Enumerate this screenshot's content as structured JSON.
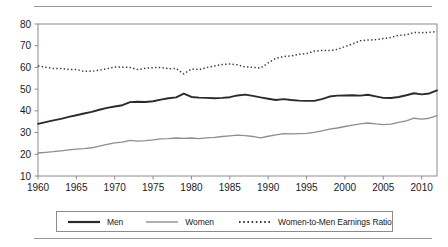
{
  "chart_data": {
    "type": "line",
    "title": "",
    "subtitle": "",
    "xlabel": "",
    "ylabel": "",
    "xlim": [
      1960,
      2012
    ],
    "ylim": [
      10,
      80
    ],
    "ytick_step": 10,
    "grid": false,
    "legend_position": "bottom",
    "xticks": [
      1960,
      1965,
      1970,
      1975,
      1980,
      1985,
      1990,
      1995,
      2000,
      2005,
      2010
    ],
    "xtick_labels": [
      "1960",
      "1965",
      "1970",
      "1975",
      "1980",
      "1985",
      "1990",
      "1995",
      "2000",
      "2005",
      "2010"
    ],
    "yticks": [
      10,
      20,
      30,
      40,
      50,
      60,
      70,
      80
    ],
    "ytick_labels": [
      "10",
      "20",
      "30",
      "40",
      "50",
      "60",
      "70",
      "80"
    ],
    "x": [
      1960,
      1961,
      1962,
      1963,
      1964,
      1965,
      1966,
      1967,
      1968,
      1969,
      1970,
      1971,
      1972,
      1973,
      1974,
      1975,
      1976,
      1977,
      1978,
      1979,
      1980,
      1981,
      1982,
      1983,
      1984,
      1985,
      1986,
      1987,
      1988,
      1989,
      1990,
      1991,
      1992,
      1993,
      1994,
      1995,
      1996,
      1997,
      1998,
      1999,
      2000,
      2001,
      2002,
      2003,
      2004,
      2005,
      2006,
      2007,
      2008,
      2009,
      2010,
      2011,
      2012
    ],
    "series": [
      {
        "name": "Men",
        "style": "solid",
        "color": "#2b2b2b",
        "width": 1.9,
        "values": [
          34.0,
          34.8,
          35.6,
          36.3,
          37.2,
          38.0,
          38.8,
          39.5,
          40.5,
          41.4,
          42.0,
          42.6,
          44.0,
          44.2,
          44.1,
          44.4,
          45.2,
          45.8,
          46.2,
          47.9,
          46.4,
          46.1,
          46.0,
          45.8,
          46.0,
          46.3,
          47.1,
          47.5,
          46.9,
          46.2,
          45.6,
          45.0,
          45.4,
          45.0,
          44.7,
          44.6,
          44.6,
          45.4,
          46.6,
          47.0,
          47.1,
          47.2,
          47.0,
          47.4,
          46.7,
          46.0,
          45.9,
          46.4,
          47.2,
          48.1,
          47.6,
          48.0,
          49.4
        ]
      },
      {
        "name": "Women",
        "style": "solid",
        "color": "#8e8e8e",
        "width": 1.3,
        "values": [
          20.6,
          20.9,
          21.2,
          21.6,
          22.0,
          22.4,
          22.6,
          23.0,
          23.8,
          24.6,
          25.3,
          25.6,
          26.4,
          26.1,
          26.3,
          26.6,
          27.1,
          27.2,
          27.5,
          27.3,
          27.5,
          27.2,
          27.6,
          27.8,
          28.2,
          28.5,
          28.8,
          28.6,
          28.2,
          27.6,
          28.3,
          28.9,
          29.5,
          29.4,
          29.5,
          29.6,
          30.1,
          30.8,
          31.6,
          32.1,
          32.8,
          33.4,
          34.0,
          34.4,
          34.0,
          33.7,
          33.9,
          34.7,
          35.4,
          36.6,
          36.2,
          36.6,
          37.8
        ]
      },
      {
        "name": "Women-to-Men Earnings Ratio",
        "style": "dotted",
        "color": "#3a3a3a",
        "width": 1.5,
        "values": [
          60.7,
          60.1,
          59.5,
          59.5,
          59.1,
          59.0,
          58.2,
          58.2,
          58.8,
          59.4,
          60.2,
          60.1,
          60.0,
          59.0,
          59.6,
          59.9,
          60.0,
          59.4,
          59.5,
          57.0,
          59.3,
          59.0,
          60.0,
          60.7,
          61.3,
          61.6,
          61.2,
          60.2,
          60.1,
          59.7,
          62.1,
          64.2,
          65.0,
          65.3,
          66.0,
          66.4,
          67.5,
          67.8,
          67.8,
          68.3,
          69.6,
          70.8,
          72.3,
          72.6,
          72.8,
          73.3,
          73.8,
          74.8,
          75.0,
          76.1,
          76.0,
          76.2,
          76.5
        ]
      }
    ],
    "legend": [
      {
        "label": "Men",
        "style": "solid",
        "color": "#2b2b2b",
        "width": 2.2
      },
      {
        "label": "Women",
        "style": "solid",
        "color": "#8e8e8e",
        "width": 1.4
      },
      {
        "label": "Women-to-Men Earnings Ratio",
        "style": "dotted",
        "color": "#3a3a3a",
        "width": 1.6
      }
    ],
    "axis_color": "#8c8c8c"
  }
}
